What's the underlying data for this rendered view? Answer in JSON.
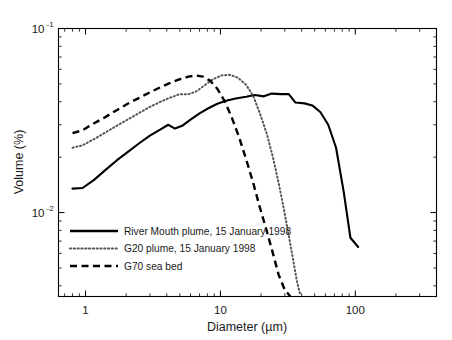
{
  "chart_data": {
    "type": "line",
    "title": "",
    "xlabel": "Diameter (µm)",
    "ylabel": "Volume (%)",
    "xscale": "log",
    "yscale": "log",
    "xlim": [
      0.63,
      400
    ],
    "ylim": [
      0.0035,
      0.1
    ],
    "grid": false,
    "legend_position": "lower-left-inside",
    "xticks": [
      {
        "value": 1,
        "label": "1"
      },
      {
        "value": 10,
        "label": "10"
      },
      {
        "value": 100,
        "label": "100"
      }
    ],
    "yticks": [
      {
        "value": 0.1,
        "label": "10",
        "exponent": "-1"
      },
      {
        "value": 0.01,
        "label": "10",
        "exponent": "-2"
      }
    ],
    "series": [
      {
        "name": "River Mouth plume, 15 January 1998",
        "style": "solid",
        "color": "#000000",
        "points": [
          [
            0.8,
            0.0135
          ],
          [
            0.95,
            0.0136
          ],
          [
            1.15,
            0.015
          ],
          [
            1.4,
            0.017
          ],
          [
            1.7,
            0.0192
          ],
          [
            2.05,
            0.0213
          ],
          [
            2.5,
            0.0238
          ],
          [
            3.0,
            0.0262
          ],
          [
            3.6,
            0.0283
          ],
          [
            4.1,
            0.03
          ],
          [
            4.6,
            0.0286
          ],
          [
            5.2,
            0.0296
          ],
          [
            6.0,
            0.032
          ],
          [
            7.0,
            0.0346
          ],
          [
            8.2,
            0.037
          ],
          [
            9.5,
            0.039
          ],
          [
            11.0,
            0.0405
          ],
          [
            13.0,
            0.0417
          ],
          [
            15.5,
            0.0426
          ],
          [
            18.0,
            0.0435
          ],
          [
            21.0,
            0.0428
          ],
          [
            24.0,
            0.0443
          ],
          [
            28.0,
            0.044
          ],
          [
            32.0,
            0.0441
          ],
          [
            36.0,
            0.0396
          ],
          [
            42.0,
            0.0392
          ],
          [
            48.0,
            0.0382
          ],
          [
            55.0,
            0.0352
          ],
          [
            63.0,
            0.03
          ],
          [
            72.0,
            0.0225
          ],
          [
            82.0,
            0.013
          ],
          [
            92.0,
            0.0073
          ],
          [
            105.0,
            0.0065
          ]
        ]
      },
      {
        "name": "G20 plume, 15 January 1998",
        "style": "dotted",
        "color": "#555555",
        "points": [
          [
            0.8,
            0.0225
          ],
          [
            0.95,
            0.0232
          ],
          [
            1.15,
            0.025
          ],
          [
            1.4,
            0.0272
          ],
          [
            1.7,
            0.0296
          ],
          [
            2.05,
            0.032
          ],
          [
            2.5,
            0.0348
          ],
          [
            3.0,
            0.0375
          ],
          [
            3.6,
            0.04
          ],
          [
            4.2,
            0.042
          ],
          [
            5.0,
            0.044
          ],
          [
            5.8,
            0.044
          ],
          [
            6.6,
            0.0455
          ],
          [
            7.6,
            0.049
          ],
          [
            8.8,
            0.053
          ],
          [
            10.2,
            0.0556
          ],
          [
            11.8,
            0.056
          ],
          [
            13.5,
            0.054
          ],
          [
            15.5,
            0.0495
          ],
          [
            17.5,
            0.043
          ],
          [
            19.5,
            0.035
          ],
          [
            22.0,
            0.027
          ],
          [
            24.5,
            0.02
          ],
          [
            27.0,
            0.0145
          ],
          [
            29.5,
            0.0105
          ],
          [
            32.0,
            0.0076
          ],
          [
            34.5,
            0.0056
          ],
          [
            37.0,
            0.0042
          ],
          [
            39.0,
            0.0036
          ]
        ]
      },
      {
        "name": "G70 sea bed",
        "style": "dashed",
        "color": "#000000",
        "points": [
          [
            0.8,
            0.027
          ],
          [
            0.95,
            0.028
          ],
          [
            1.15,
            0.0305
          ],
          [
            1.4,
            0.033
          ],
          [
            1.7,
            0.036
          ],
          [
            2.05,
            0.039
          ],
          [
            2.5,
            0.042
          ],
          [
            3.0,
            0.045
          ],
          [
            3.6,
            0.048
          ],
          [
            4.2,
            0.0505
          ],
          [
            5.0,
            0.053
          ],
          [
            5.8,
            0.0548
          ],
          [
            6.6,
            0.0556
          ],
          [
            7.4,
            0.0548
          ],
          [
            8.4,
            0.052
          ],
          [
            9.5,
            0.047
          ],
          [
            10.8,
            0.04
          ],
          [
            12.2,
            0.0325
          ],
          [
            13.8,
            0.0255
          ],
          [
            15.5,
            0.0195
          ],
          [
            17.5,
            0.0145
          ],
          [
            19.5,
            0.0108
          ],
          [
            22.0,
            0.008
          ],
          [
            24.5,
            0.006
          ],
          [
            27.0,
            0.0046
          ],
          [
            30.0,
            0.0038
          ],
          [
            33.0,
            0.0035
          ]
        ]
      }
    ]
  },
  "legend": {
    "entries": [
      {
        "label": "River Mouth plume, 15 January 1998",
        "style": "solid"
      },
      {
        "label": "G20 plume, 15 January 1998",
        "style": "dotted"
      },
      {
        "label": "G70 sea bed",
        "style": "dashed"
      }
    ]
  }
}
